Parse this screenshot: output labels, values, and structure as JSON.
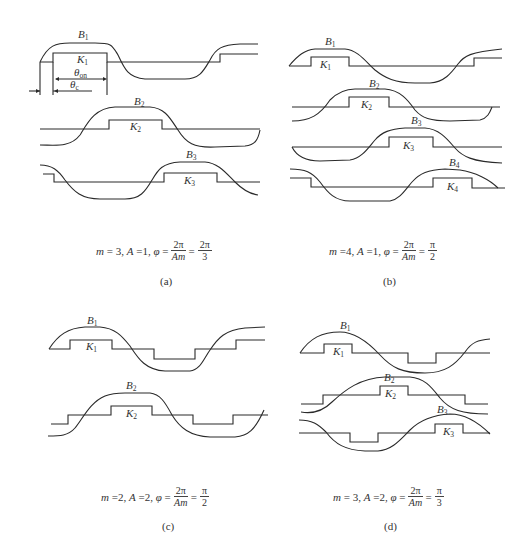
{
  "panels": [
    {
      "id": "a",
      "caption": "(a)",
      "equation": {
        "m": "3",
        "A": "1",
        "phi_num": "2π",
        "phi_den": "Am",
        "result_num": "2π",
        "result_den": "3"
      },
      "curves": [
        {
          "B": "B",
          "B_sub": "1",
          "K": "K",
          "K_sub": "1"
        },
        {
          "B": "B",
          "B_sub": "2",
          "K": "K",
          "K_sub": "2"
        },
        {
          "B": "B",
          "B_sub": "3",
          "K": "K",
          "K_sub": "3"
        }
      ],
      "annotations": {
        "theta_on": "θ",
        "theta_on_sub": "on",
        "theta_c": "θ",
        "theta_c_sub": "c"
      }
    },
    {
      "id": "b",
      "caption": "(b)",
      "equation": {
        "m": "4",
        "A": "1",
        "phi_num": "2π",
        "phi_den": "Am",
        "result_num": "π",
        "result_den": "2"
      },
      "curves": [
        {
          "B": "B",
          "B_sub": "1",
          "K": "K",
          "K_sub": "1"
        },
        {
          "B": "B",
          "B_sub": "2",
          "K": "K",
          "K_sub": "2"
        },
        {
          "B": "B",
          "B_sub": "3",
          "K": "K",
          "K_sub": "3"
        },
        {
          "B": "B",
          "B_sub": "4",
          "K": "K",
          "K_sub": "4"
        }
      ]
    },
    {
      "id": "c",
      "caption": "(c)",
      "equation": {
        "m": "2",
        "A": "2",
        "phi_num": "2π",
        "phi_den": "Am",
        "result_num": "π",
        "result_den": "2"
      },
      "curves": [
        {
          "B": "B",
          "B_sub": "1",
          "K": "K",
          "K_sub": "1"
        },
        {
          "B": "B",
          "B_sub": "2",
          "K": "K",
          "K_sub": "2"
        }
      ]
    },
    {
      "id": "d",
      "caption": "(d)",
      "equation": {
        "m": "3",
        "A": "2",
        "phi_num": "2π",
        "phi_den": "Am",
        "result_num": "π",
        "result_den": "3"
      },
      "curves": [
        {
          "B": "B",
          "B_sub": "1",
          "K": "K",
          "K_sub": "1"
        },
        {
          "B": "B",
          "B_sub": "2",
          "K": "K",
          "K_sub": "2"
        },
        {
          "B": "B",
          "B_sub": "3",
          "K": "K",
          "K_sub": "3"
        }
      ]
    }
  ],
  "symbols": {
    "m": "m",
    "A": "A",
    "phi": "φ",
    "eq": "=",
    "comma": ","
  }
}
